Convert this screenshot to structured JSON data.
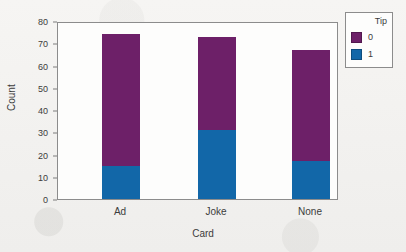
{
  "chart_data": {
    "type": "bar",
    "subtype": "stacked-bar",
    "title": "",
    "xlabel": "Card",
    "ylabel": "Count",
    "categories": [
      "Ad",
      "Joke",
      "None"
    ],
    "series": [
      {
        "name": "0",
        "label": "0",
        "color": "#6d2068",
        "values": [
          59,
          42,
          50
        ]
      },
      {
        "name": "1",
        "label": "1",
        "color": "#1267a8",
        "values": [
          15,
          31,
          17
        ]
      }
    ],
    "totals": [
      74,
      73,
      67
    ],
    "ylim": [
      0,
      80
    ],
    "yticks": [
      0,
      10,
      20,
      30,
      40,
      50,
      60,
      70,
      80
    ],
    "grid": false,
    "legend": {
      "title": "Tip",
      "position": "right-outside",
      "entries": [
        "0",
        "1"
      ]
    }
  },
  "legend": {
    "title": "Tip",
    "items": [
      {
        "label": "0",
        "color": "#6d2068"
      },
      {
        "label": "1",
        "color": "#1267a8"
      }
    ]
  },
  "axes": {
    "y_title": "Count",
    "x_title": "Card",
    "y_tick_labels": [
      "0",
      "10",
      "20",
      "30",
      "40",
      "50",
      "60",
      "70",
      "80"
    ],
    "x_tick_labels": [
      "Ad",
      "Joke",
      "None"
    ]
  },
  "colors": {
    "tip_0": "#6d2068",
    "tip_1": "#1267a8",
    "frame": "#8c8c8c",
    "background": "#f4f3f1",
    "plot_background": "#fdfdfc",
    "text": "#3c3c3c"
  }
}
